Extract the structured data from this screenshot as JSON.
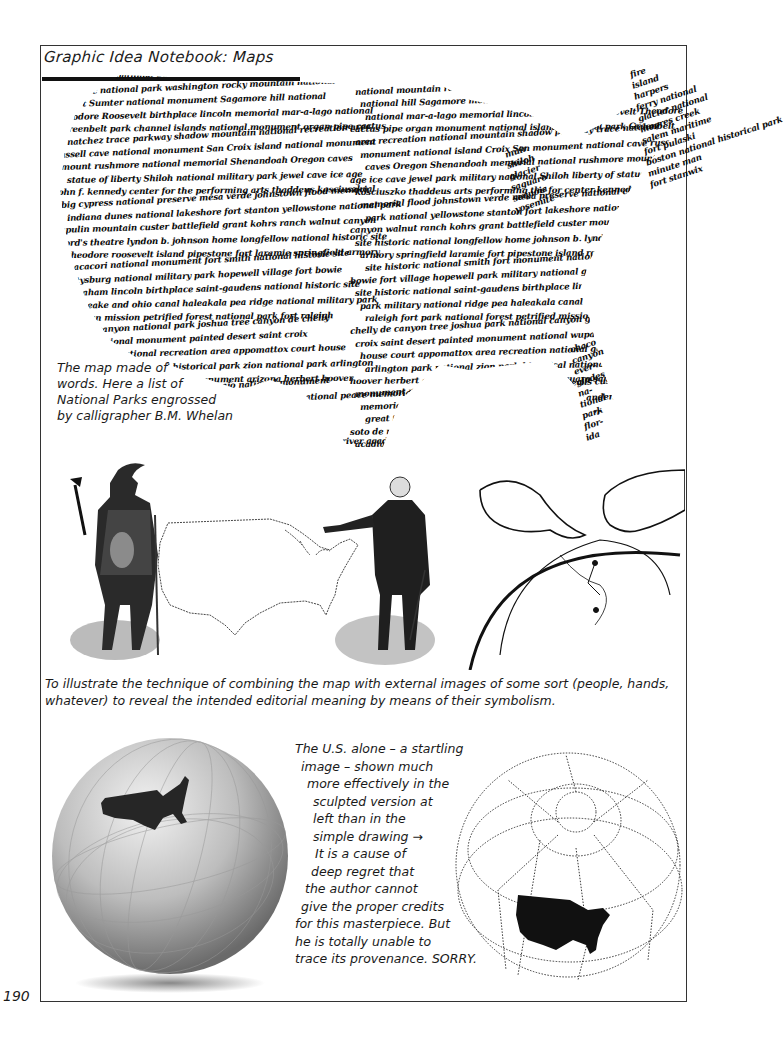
{
  "page": {
    "title": "Graphic Idea Notebook: Maps",
    "page_number": "190"
  },
  "word_map": {
    "description": "Map of the United States made of calligraphic words listing National Parks",
    "lines": [
      "Shenandoah national park Cumberland gap national his",
      "olympic national park washington rocky mountain national",
      "Fort Sumter national monument Sagamore hill national",
      "Theodore Roosevelt birthplace lincoln memorial mar-a-lago national",
      "Greenbelt park channel islands national monument organ pipe cactus",
      "natchez trace parkway shadow mountain national recreation area",
      "russell cave national monument San Croix island national monument",
      "mount rushmore national memorial Shenandoah Oregon caves",
      "statue of liberty Shiloh national military park jewel cave ice age",
      "john f. kennedy center for the performing arts thaddeus kosciuszko",
      "big cypress national preserve mesa verde johnstown flood memorial",
      "indiana dunes national lakeshore fort stanton yellowstone national park",
      "capulin mountain custer battlefield grant kohrs ranch walnut canyon",
      "ford's theatre lyndon b. johnson home longfellow national historic site",
      "theodore roosevelt island pipestone fort laramie springfield armory",
      "tumacacori national monument fort smith national historic site",
      "gettysburg national military park hopewell village fort bowie",
      "abraham lincoln birthplace saint-gaudens national historic site",
      "chesapeake and ohio canal haleakala pea ridge national military park",
      "whitman mission petrified forest national park fort raleigh",
      "grand canyon national park joshua tree canyon de chelly",
      "wupatki national monument painted desert saint croix",
      "golden gate national recreation area appomattox court house",
      "city of refuge national historical park zion national park arlington",
      "white sands saguaro national monument arizona herbert hoover",
      "custer battle-field-devils tower navajo national monument",
      "casa grande andersonville perrys victory and international peace memorial",
      "eisenhower national historic site grand teton great",
      "pennsylvania avenue national de soto",
      "san juan coulee dam big thicket blue ridge cabrillo buffalo river acadia"
    ],
    "northeast_stack": [
      "fire",
      "island",
      "harpers",
      "ferry national",
      "glacier national",
      "moores creek",
      "salem maritime",
      "fort pulaski",
      "boston national historical park",
      "minute man",
      "fort stanwix"
    ],
    "great_lakes_stack": [
      "muir",
      "shiloh",
      "glacier",
      "saguaro",
      "sequoia",
      "yosemite"
    ],
    "florida_stack": [
      "chaco",
      "canyon",
      "ever-",
      "glades",
      "na-",
      "tional",
      "park",
      "flor-",
      "ida"
    ],
    "caption": [
      "The map made of",
      "words. Here a list of",
      "National Parks engrossed",
      "by calligrapher B.M. Whelan"
    ]
  },
  "illustrations": {
    "left": "Native American figure holding a tomahawk beside an outline map of the U.S.",
    "center": "George Washington gesturing toward the U.S. outline map",
    "right": "Two hands placing pins on a globe"
  },
  "caption_middle": [
    "To illustrate the technique of combining the map with external images of some sort (people, hands,",
    "whatever) to reveal the intended editorial meaning by means of their symbolism."
  ],
  "globes": {
    "left": "Sculpted globe with the U.S. raised in dark relief",
    "right": "Simple dotted-line globe drawing with U.S. silhouette",
    "notes": [
      "The U.S. alone – a startling",
      "image – shown much",
      "more effectively in the",
      "sculpted version at",
      "left than in the",
      "simple drawing →",
      "It is a cause of",
      "deep regret that",
      "the author cannot",
      "give the proper credits",
      "for this masterpiece. But",
      "he is totally unable to",
      "trace its provenance. SORRY."
    ]
  },
  "colors": {
    "ink": "#111111",
    "paper": "#ffffff",
    "frame": "#333333"
  }
}
